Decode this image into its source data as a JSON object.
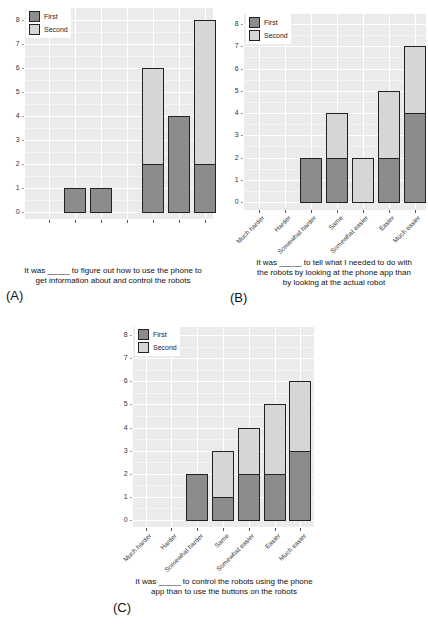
{
  "legend": {
    "first": "First",
    "second": "Second"
  },
  "colors": {
    "first": "#8c8c8c",
    "second": "#d6d6d6",
    "panel_bg": "#ebebeb",
    "bar_border": "#222222"
  },
  "chart_data": [
    {
      "panel": "(A)",
      "type": "bar",
      "stacked": true,
      "title": "",
      "xlabel": "It was _____ to figure out how to use the phone to get information about and control the robots",
      "ylabel": "",
      "ylim": [
        0,
        8
      ],
      "yticks": [
        0,
        1,
        2,
        3,
        4,
        5,
        6,
        7,
        8
      ],
      "grid": true,
      "legend_position": "top-left inside",
      "categories": [
        "Very hard",
        "Hard",
        "Somewhat hard",
        "Same",
        "Somewhat easy",
        "Easy",
        "Very easy"
      ],
      "series": [
        {
          "name": "First",
          "values": [
            0,
            1,
            1,
            0,
            2,
            4,
            2
          ]
        },
        {
          "name": "Second",
          "values": [
            0,
            0,
            0,
            0,
            4,
            0,
            6
          ]
        }
      ]
    },
    {
      "panel": "(B)",
      "type": "bar",
      "stacked": true,
      "title": "",
      "xlabel": "It was _____ to tell what I needed to do with the robots by looking at the phone app than by looking at the actual robot",
      "ylabel": "",
      "ylim": [
        0,
        8
      ],
      "yticks": [
        0,
        1,
        2,
        3,
        4,
        5,
        6,
        7,
        8
      ],
      "grid": true,
      "legend_position": "top-left inside",
      "categories": [
        "Much harder",
        "Harder",
        "Somewhat harder",
        "Same",
        "Somewhat easier",
        "Easier",
        "Much easier"
      ],
      "series": [
        {
          "name": "First",
          "values": [
            0,
            0,
            2,
            2,
            0,
            2,
            4
          ]
        },
        {
          "name": "Second",
          "values": [
            0,
            0,
            0,
            2,
            2,
            3,
            3
          ]
        }
      ]
    },
    {
      "panel": "(C)",
      "type": "bar",
      "stacked": true,
      "title": "",
      "xlabel": "It was _____ to control the robots using the phone app than to use the buttons on the robots",
      "ylabel": "",
      "ylim": [
        0,
        8
      ],
      "yticks": [
        0,
        1,
        2,
        3,
        4,
        5,
        6,
        7,
        8
      ],
      "grid": true,
      "legend_position": "top-left inside",
      "categories": [
        "Much harder",
        "Harder",
        "Somewhat harder",
        "Same",
        "Somewhat easier",
        "Easier",
        "Much easier"
      ],
      "series": [
        {
          "name": "First",
          "values": [
            0,
            0,
            2,
            1,
            2,
            2,
            3
          ]
        },
        {
          "name": "Second",
          "values": [
            0,
            0,
            0,
            2,
            2,
            3,
            3
          ]
        }
      ]
    }
  ],
  "captions": {
    "a": {
      "line1": "It was _____ to figure out how to use the phone to",
      "line2": "get information about and control the robots",
      "label": "(A)"
    },
    "b": {
      "line1": "It was _____ to tell what I needed to do with",
      "line2": "the robots by looking at the phone app than",
      "line3": "by looking at the actual robot",
      "label": "(B)"
    },
    "c": {
      "line1": "It was _____ to control the robots using the phone",
      "line2": "app than to use the buttons on the robots",
      "label": "(C)"
    }
  }
}
